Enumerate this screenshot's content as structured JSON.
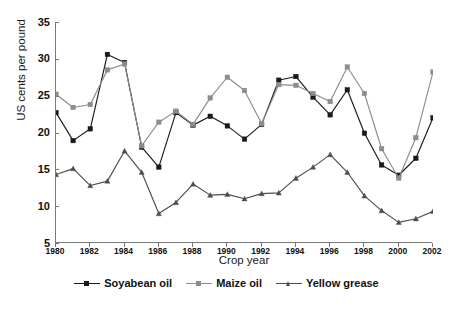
{
  "chart_data": {
    "type": "line",
    "title": "",
    "xlabel": "Crop year",
    "ylabel": "US cents per pound",
    "x": [
      1980,
      1981,
      1982,
      1983,
      1984,
      1985,
      1986,
      1987,
      1988,
      1989,
      1990,
      1991,
      1992,
      1993,
      1994,
      1995,
      1996,
      1997,
      1998,
      1999,
      2000,
      2001,
      2002
    ],
    "xlim": [
      1980,
      2002
    ],
    "ylim": [
      5,
      35
    ],
    "yticks": [
      5,
      10,
      15,
      20,
      25,
      30,
      35
    ],
    "xticks": [
      1980,
      1982,
      1984,
      1986,
      1988,
      1990,
      1992,
      1994,
      1996,
      1998,
      2000,
      2002
    ],
    "grid": false,
    "legend_position": "bottom",
    "series": [
      {
        "name": "Soyabean oil",
        "color": "#1a1a1a",
        "marker": "square",
        "values": [
          22.7,
          18.9,
          20.5,
          30.6,
          29.5,
          18.0,
          15.3,
          22.7,
          21.0,
          22.2,
          20.9,
          19.1,
          21.1,
          27.1,
          27.6,
          24.8,
          22.4,
          25.8,
          19.9,
          15.6,
          14.2,
          16.5,
          22.0
        ]
      },
      {
        "name": "Maize oil",
        "color": "#8c8c8c",
        "marker": "square",
        "values": [
          25.2,
          23.4,
          23.8,
          28.5,
          29.3,
          18.2,
          21.4,
          22.9,
          21.1,
          24.7,
          27.5,
          25.7,
          21.2,
          26.5,
          26.4,
          25.3,
          24.2,
          28.9,
          25.3,
          17.8,
          13.8,
          19.3,
          28.2
        ]
      },
      {
        "name": "Yellow grease",
        "color": "#4d4d4d",
        "marker": "triangle",
        "values": [
          14.3,
          15.1,
          12.8,
          13.4,
          17.5,
          14.6,
          9.0,
          10.5,
          13.0,
          11.5,
          11.6,
          11.0,
          11.7,
          11.8,
          13.8,
          15.3,
          17.0,
          14.6,
          11.4,
          9.4,
          7.8,
          8.3,
          9.3
        ]
      }
    ]
  },
  "axis": {
    "y_title": "US cents per pound",
    "x_title": "Crop year",
    "y_tick_labels": [
      "35",
      "30",
      "25",
      "20",
      "15",
      "10",
      "5"
    ],
    "x_tick_labels": [
      "1980",
      "1982",
      "1984",
      "1986",
      "1988",
      "1990",
      "1992",
      "1994",
      "1996",
      "1998",
      "2000",
      "2002"
    ]
  },
  "legend": {
    "items": [
      {
        "label": "Soyabean oil",
        "color": "#1a1a1a"
      },
      {
        "label": "Maize oil",
        "color": "#8c8c8c"
      },
      {
        "label": "Yellow grease",
        "color": "#4d4d4d"
      }
    ]
  },
  "style": {
    "axis_color": "#7a7a7a",
    "text_color": "#111111",
    "background": "#ffffff"
  }
}
